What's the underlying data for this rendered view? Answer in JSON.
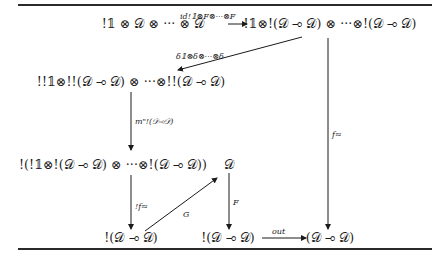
{
  "diagram": {
    "nodes": {
      "top_left": "!𝟙 ⊗ 𝒟 ⊗ ··· ⊗ 𝒟",
      "top_right": "!𝟙⊗!(𝒟 ⊸ 𝒟) ⊗ ···⊗!(𝒟 ⊸ 𝒟)",
      "mid": "!!𝟙⊗!!(𝒟 ⊸ 𝒟) ⊗ ···⊗!!(𝒟 ⊸ 𝒟)",
      "lower": "!(!𝟙⊗!(𝒟 ⊸ 𝒟) ⊗ ···⊗!(𝒟 ⊸ 𝒟))",
      "d": "𝒟",
      "bottom_left": "!(𝒟 ⊸ 𝒟)",
      "bottom_mid": "!(𝒟 ⊸ 𝒟)",
      "bottom_right": "(𝒟 ⊸ 𝒟)"
    },
    "arrows": {
      "top": "id!𝟙⊗F⊗···⊗F",
      "delta": "δ𝟙⊗δ⊗···⊗δ",
      "m": "mⁿ!(𝒟⊸𝒟)",
      "bang_f": "!f≈",
      "g": "G",
      "f_map": "F",
      "out": "out",
      "f_approx": "f≈"
    }
  }
}
